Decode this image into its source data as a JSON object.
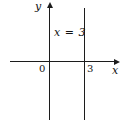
{
  "figure": {
    "type": "coordinate-plane",
    "equation_label": "x = 3",
    "y_axis_label": "y",
    "x_axis_label": "x",
    "origin_label": "0",
    "x_tick_label": "3",
    "depicted_line": {
      "equation": "x = 3",
      "orientation": "vertical",
      "x_intercept": 3
    },
    "colors": {
      "background": "#ffffff",
      "line": "#1c1c1c",
      "text": "#111111"
    }
  }
}
